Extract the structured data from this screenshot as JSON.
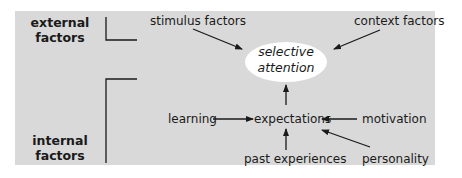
{
  "diagram": {
    "groups": {
      "external": "external factors",
      "external_line1": "external",
      "external_line2": "factors",
      "internal_line1": "internal",
      "internal_line2": "factors"
    },
    "nodes": {
      "stimulus": "stimulus factors",
      "context": "context factors",
      "center_line1": "selective",
      "center_line2": "attention",
      "expectations": "expectations",
      "learning": "learning",
      "motivation": "motivation",
      "past": "past experiences",
      "personality": "personality"
    },
    "edges": [
      {
        "from": "stimulus factors",
        "to": "selective attention"
      },
      {
        "from": "context factors",
        "to": "selective attention"
      },
      {
        "from": "expectations",
        "to": "selective attention"
      },
      {
        "from": "learning",
        "to": "expectations"
      },
      {
        "from": "motivation",
        "to": "expectations"
      },
      {
        "from": "past experiences",
        "to": "expectations"
      },
      {
        "from": "personality",
        "to": "expectations"
      }
    ],
    "colors": {
      "panel": "#d9d9d9",
      "ellipse": "#ffffff",
      "text": "#1a1a1a"
    }
  }
}
